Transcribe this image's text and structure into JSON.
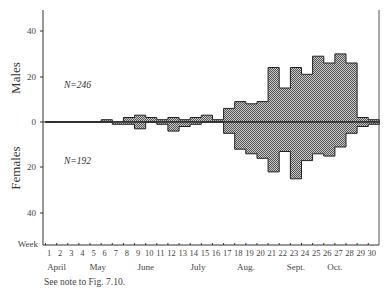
{
  "chart_data": {
    "type": "bar",
    "subtype": "back-to-back histogram",
    "title": "",
    "xlabel": "Week",
    "ylabel_top": "Males",
    "ylabel_bottom": "Females",
    "y_ticks_males": [
      0,
      20,
      40
    ],
    "y_ticks_females": [
      20,
      40
    ],
    "ylim": [
      -48,
      48
    ],
    "x_weeks": [
      1,
      2,
      3,
      4,
      5,
      6,
      7,
      8,
      9,
      10,
      11,
      12,
      13,
      14,
      15,
      16,
      17,
      18,
      19,
      20,
      21,
      22,
      23,
      24,
      25,
      26,
      27,
      28,
      29,
      30
    ],
    "months": [
      {
        "label": "April",
        "week": 2
      },
      {
        "label": "May",
        "week": 5.7
      },
      {
        "label": "June",
        "week": 10
      },
      {
        "label": "July",
        "week": 14.7
      },
      {
        "label": "Aug.",
        "week": 19
      },
      {
        "label": "Sept.",
        "week": 23.5
      },
      {
        "label": "Oct.",
        "week": 27
      }
    ],
    "series": [
      {
        "name": "Males",
        "N": 246,
        "values": [
          0,
          0,
          0,
          0,
          0,
          1,
          0,
          2,
          3,
          2,
          1,
          2,
          1,
          2,
          3,
          1,
          6,
          9,
          8,
          9,
          24,
          15,
          24,
          21,
          29,
          26,
          30,
          26,
          2,
          1
        ]
      },
      {
        "name": "Females",
        "N": 192,
        "values": [
          0,
          0,
          0,
          0,
          0,
          0,
          1,
          1,
          3,
          0,
          1,
          4,
          2,
          1,
          0,
          0,
          5,
          12,
          14,
          16,
          22,
          13,
          25,
          17,
          14,
          15,
          11,
          5,
          2,
          1
        ]
      }
    ],
    "annotations": [
      "N=246",
      "N=192"
    ],
    "grid": false,
    "legend": "none"
  },
  "labels": {
    "males": "Males",
    "females": "Females",
    "week": "Week",
    "n_males": "N=246",
    "n_females": "N=192",
    "tick_40": "40",
    "tick_20": "20",
    "tick_0": "0"
  },
  "note": "See note to Fig. 7.10."
}
